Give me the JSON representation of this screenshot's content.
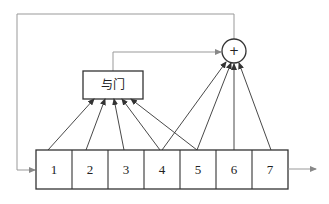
{
  "diagram": {
    "type": "shift-register-feedback",
    "and_gate": {
      "label": "与门",
      "inputs_from_cells": [
        1,
        2,
        3,
        4,
        5
      ]
    },
    "xor_node": {
      "symbol": "+",
      "inputs_from_cells": [
        4,
        5,
        6,
        7
      ],
      "extra_input": "and_gate_output"
    },
    "feedback": {
      "from": "xor_node",
      "to_cell": 1
    },
    "register": {
      "cells": [
        {
          "label": "1"
        },
        {
          "label": "2"
        },
        {
          "label": "3"
        },
        {
          "label": "4"
        },
        {
          "label": "5"
        },
        {
          "label": "6"
        },
        {
          "label": "7"
        }
      ]
    },
    "output": {
      "from_cell": 7,
      "direction": "right"
    },
    "colors": {
      "line": "#333333",
      "thin_line": "#8a8a8a",
      "background": "#ffffff"
    }
  }
}
